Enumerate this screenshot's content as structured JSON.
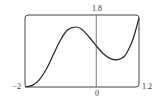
{
  "chart_data": {
    "type": "line",
    "title": "",
    "xlabel": "",
    "ylabel": "",
    "xlim": [
      -2,
      1.2
    ],
    "ylim": [
      0,
      1.8
    ],
    "grid": false,
    "legend": null,
    "tick_labels": {
      "x_left": "−2",
      "x_zero": "0",
      "x_right": "1.2",
      "y_top": "1.8"
    },
    "series": [
      {
        "name": "f(x)",
        "x": [
          -2.0,
          -1.8,
          -1.6,
          -1.4,
          -1.2,
          -1.0,
          -0.8,
          -0.57,
          -0.4,
          -0.2,
          0.0,
          0.2,
          0.4,
          0.58,
          0.8,
          1.0,
          1.1,
          1.2
        ],
        "y": [
          0.0,
          0.04,
          0.18,
          0.45,
          0.82,
          1.18,
          1.43,
          1.5,
          1.44,
          1.25,
          1.03,
          0.83,
          0.71,
          0.68,
          0.78,
          1.12,
          1.4,
          1.73
        ]
      }
    ]
  },
  "colors": {
    "curve": "#222222",
    "frame": "#444444",
    "axis": "#555555"
  }
}
